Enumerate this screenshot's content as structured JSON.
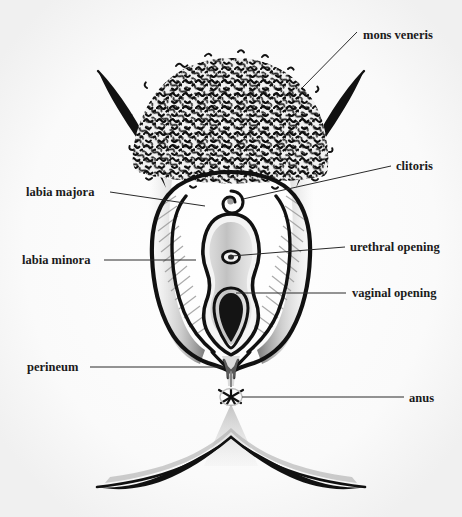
{
  "figure": {
    "background_color": "#fbfbfb",
    "ink_color": "#111111",
    "label_color": "#1a1a1a",
    "leader_color": "#2a2a2a",
    "shading_color": "#8d8d8d"
  },
  "labels": {
    "mons_veneris": "mons veneris",
    "clitoris": "clitoris",
    "urethral_opening": "urethral opening",
    "vaginal_opening": "vaginal opening",
    "labia_majora": "labia majora",
    "labia_minora": "labia minora",
    "perineum": "perineum",
    "anus": "anus"
  },
  "parts": [
    {
      "key": "mons_veneris",
      "label": "mons veneris",
      "side": "right",
      "label_x": 363,
      "label_y": 35,
      "leader": "M 357 32 L 302 88"
    },
    {
      "key": "clitoris",
      "label": "clitoris",
      "side": "right",
      "label_x": 396,
      "label_y": 170,
      "leader": "M 391 166 L 243 199"
    },
    {
      "key": "urethral_opening",
      "label": "urethral opening",
      "side": "right",
      "label_x": 350,
      "label_y": 251,
      "leader": "M 345 247 L 232 256"
    },
    {
      "key": "vaginal_opening",
      "label": "vaginal opening",
      "side": "right",
      "label_x": 352,
      "label_y": 297,
      "leader": "M 346 293 L 236 293"
    },
    {
      "key": "labia_majora",
      "label": "labia majora",
      "side": "left",
      "label_x": 26,
      "label_y": 195,
      "leader": "M 110 192 L 205 206"
    },
    {
      "key": "labia_minora",
      "label": "labia minora",
      "side": "left",
      "label_x": 22,
      "label_y": 264,
      "leader": "M 104 260 L 196 260"
    },
    {
      "key": "perineum",
      "label": "perineum",
      "side": "left",
      "label_x": 27,
      "label_y": 371,
      "leader": "M 90 367 L 224 367"
    },
    {
      "key": "anus",
      "label": "anus",
      "side": "right",
      "label_x": 409,
      "label_y": 402,
      "leader": "M 404 397 L 242 397"
    }
  ]
}
